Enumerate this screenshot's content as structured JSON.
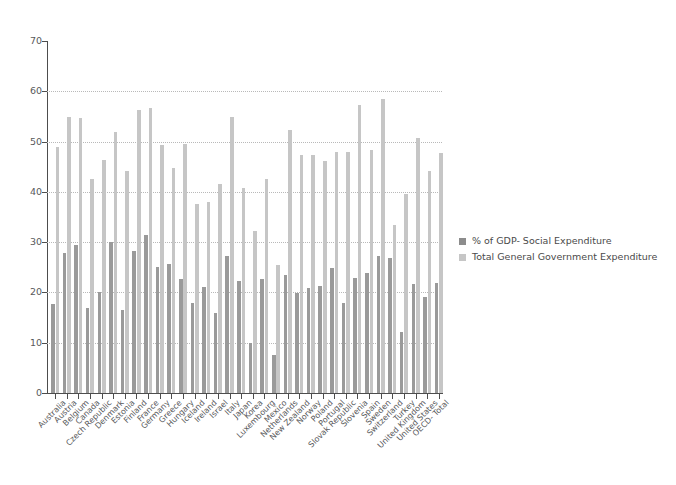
{
  "chart_data": {
    "type": "bar",
    "title": "",
    "subtitle": "",
    "xlabel": "",
    "ylabel": "",
    "ylim": [
      0,
      70
    ],
    "ytick_step": 10,
    "yticks": [
      0,
      10,
      20,
      30,
      40,
      50,
      60,
      70
    ],
    "grid": "horizontal-dotted",
    "legend_position": "right",
    "categories": [
      "Australia",
      "Austria",
      "Belgium",
      "Canada",
      "Czech Republic",
      "Denmark",
      "Estonia",
      "Finland",
      "France",
      "Germany",
      "Greece",
      "Hungary",
      "Iceland",
      "Ireland",
      "Israel",
      "Italy",
      "Japan",
      "Korea",
      "Luxembourg",
      "Mexico",
      "Netherlands",
      "New Zealand",
      "Norway",
      "Poland",
      "Portugal",
      "Slovak Republic",
      "Slovenia",
      "Spain",
      "Sweden",
      "Switzerland",
      "Turkey",
      "United Kingdom",
      "United States",
      "OECD- Total"
    ],
    "series": [
      {
        "name": "% of GDP- Social Expenditure",
        "color": "#9a9a9a",
        "values": [
          17.8,
          27.8,
          29.4,
          17.0,
          20.0,
          30.1,
          16.5,
          28.3,
          31.4,
          25.1,
          25.7,
          22.6,
          17.9,
          21.0,
          16.0,
          27.3,
          22.2,
          9.9,
          22.7,
          7.5,
          23.4,
          19.9,
          20.9,
          21.2,
          24.8,
          18.0,
          22.9,
          23.9,
          27.2,
          26.8,
          12.2,
          21.7,
          19.0,
          21.8
        ]
      },
      {
        "name": "Total General Government Expenditure",
        "color": "#c6c6c6",
        "values": [
          48.9,
          54.9,
          54.7,
          42.5,
          46.3,
          52.0,
          44.1,
          56.2,
          56.6,
          49.4,
          44.8,
          49.6,
          37.6,
          38.0,
          41.5,
          54.9,
          40.7,
          32.3,
          42.6,
          25.4,
          52.4,
          47.3,
          47.3,
          46.2,
          48.0,
          47.9,
          57.2,
          48.3,
          58.4,
          33.5,
          39.6,
          50.8,
          44.2,
          47.8
        ]
      }
    ]
  },
  "legend": {
    "items": [
      {
        "label": "% of GDP- Social Expenditure"
      },
      {
        "label": "Total General Government Expenditure"
      }
    ]
  },
  "colors": {
    "background": "#ffffff",
    "axis": "#4d4d4d",
    "gridline": "#b9b9b9",
    "tick_text": "#58595b",
    "legend_text": "#4a4a4a",
    "series_social": "#9a9a9a",
    "series_total": "#c6c6c6"
  }
}
